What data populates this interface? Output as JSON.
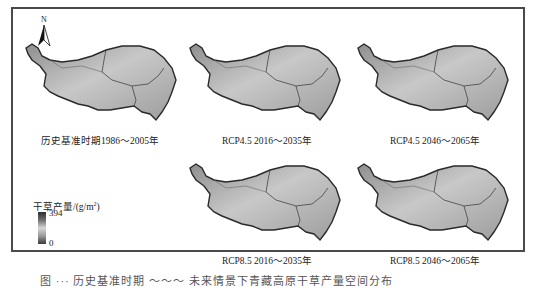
{
  "figure": {
    "north_arrow_label": "N",
    "panels": [
      {
        "label": "历史基准时期1986～2005年"
      },
      {
        "label": "RCP4.5 2016～2035年"
      },
      {
        "label": "RCP4.5 2046～2065年"
      },
      {
        "label": "RCP8.5 2016～2035年"
      },
      {
        "label": "RCP8.5 2046～2065年"
      }
    ],
    "legend": {
      "title": "干草产量/(g/m",
      "title_sup": "2",
      "title_close": ")",
      "max": "394",
      "min": "0"
    },
    "caption": "图 ···  历史基准时期 ～～～ 未来情景下青藏高原干草产量空间分布"
  },
  "colors": {
    "frame": "#4a4a4a",
    "map_light": "#e2e2e2",
    "map_dark": "#8a8a8a",
    "outline": "#2a2a2a"
  }
}
